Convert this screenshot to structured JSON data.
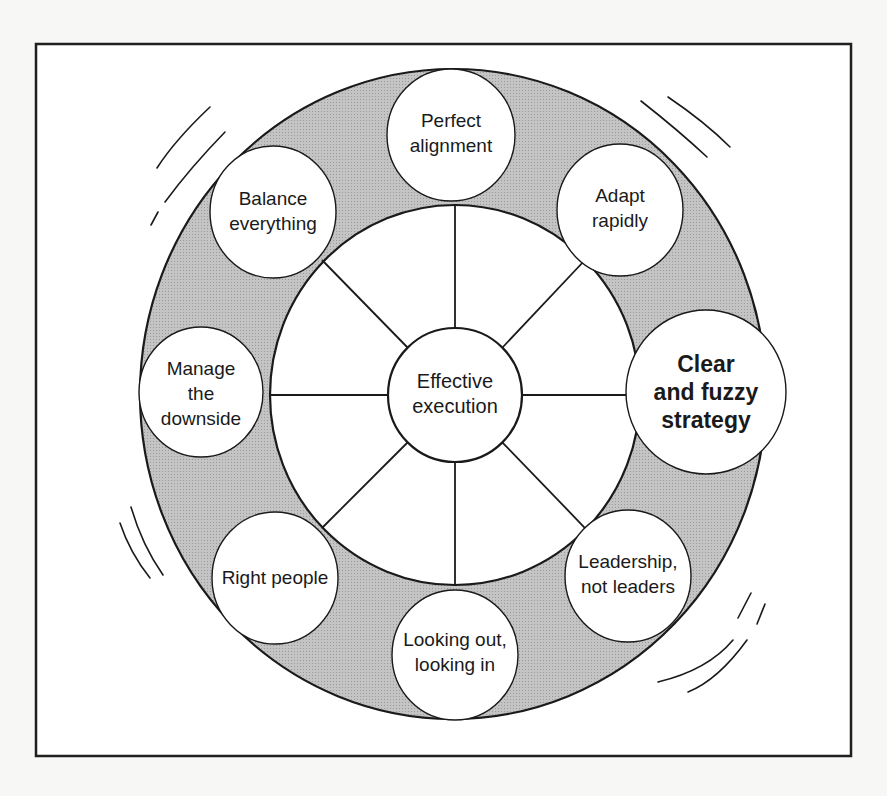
{
  "diagram": {
    "title": "",
    "center": {
      "id": "effective-execution",
      "lines": [
        "Effective",
        "execution"
      ]
    },
    "nodes": [
      {
        "id": "perfect-alignment",
        "lines": [
          "Perfect",
          "alignment"
        ],
        "emphasis": false
      },
      {
        "id": "adapt-rapidly",
        "lines": [
          "Adapt",
          "rapidly"
        ],
        "emphasis": false
      },
      {
        "id": "clear-and-fuzzy-strategy",
        "lines": [
          "Clear",
          "and fuzzy",
          "strategy"
        ],
        "emphasis": true
      },
      {
        "id": "leadership-not-leaders",
        "lines": [
          "Leadership,",
          "not leaders"
        ],
        "emphasis": false
      },
      {
        "id": "looking-out-looking-in",
        "lines": [
          "Looking out,",
          "looking in"
        ],
        "emphasis": false
      },
      {
        "id": "right-people",
        "lines": [
          "Right people"
        ],
        "emphasis": false
      },
      {
        "id": "manage-the-downside",
        "lines": [
          "Manage",
          "the",
          "downside"
        ],
        "emphasis": false
      },
      {
        "id": "balance-everything",
        "lines": [
          "Balance",
          "everything"
        ],
        "emphasis": false
      }
    ],
    "colors": {
      "ring_fill": "#b9b9b9",
      "stroke": "#1a1a1a",
      "node_fill": "#ffffff",
      "frame": "#1f1f1f",
      "background": "#f7f7f6"
    }
  }
}
